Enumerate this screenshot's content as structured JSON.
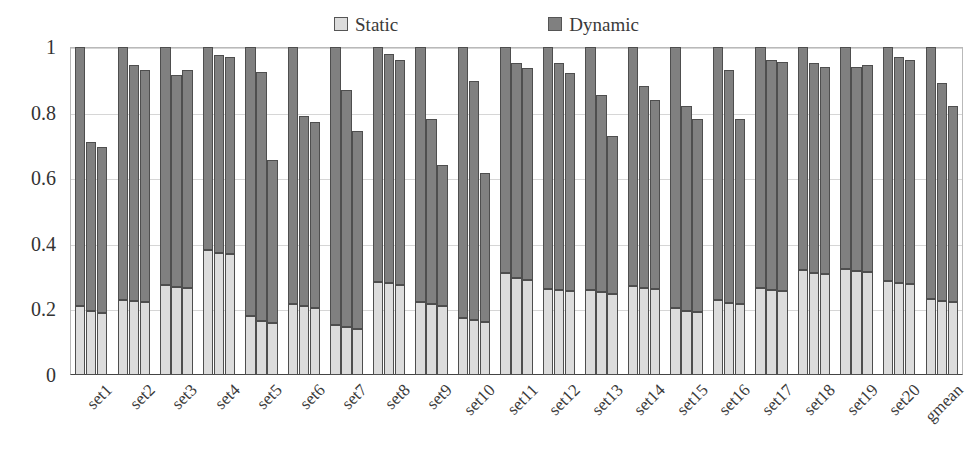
{
  "chart_data": {
    "type": "bar",
    "title": "",
    "subtitle": "",
    "xlabel": "",
    "ylabel": "",
    "ylim": [
      0,
      1
    ],
    "ytick_labels": [
      "0",
      "0.2",
      "0.4",
      "0.6",
      "0.8",
      "1"
    ],
    "ytick_values": [
      0,
      0.2,
      0.4,
      0.6,
      0.8,
      1
    ],
    "grid": true,
    "stacked": true,
    "legend_position": "top-center",
    "legend": [
      {
        "name": "Static",
        "color": "#dcdcdc",
        "icon": "legend-swatch-static"
      },
      {
        "name": "Dynamic",
        "color": "#808080",
        "icon": "legend-swatch-dynamic"
      }
    ],
    "series_names": [
      "Static",
      "Dynamic"
    ],
    "bars_per_group": 3,
    "categories": [
      "set1",
      "set2",
      "set3",
      "set4",
      "set5",
      "set6",
      "set7",
      "set8",
      "set9",
      "set10",
      "set11",
      "set12",
      "set13",
      "set14",
      "set15",
      "set16",
      "set17",
      "set18",
      "set19",
      "set20",
      "gmean"
    ],
    "groups": [
      {
        "category": "set1",
        "bars": [
          {
            "static": 0.21,
            "dynamic": 0.79,
            "total": 1.0
          },
          {
            "static": 0.195,
            "dynamic": 0.515,
            "total": 0.71
          },
          {
            "static": 0.19,
            "dynamic": 0.505,
            "total": 0.695
          }
        ]
      },
      {
        "category": "set2",
        "bars": [
          {
            "static": 0.23,
            "dynamic": 0.77,
            "total": 1.0
          },
          {
            "static": 0.225,
            "dynamic": 0.72,
            "total": 0.945
          },
          {
            "static": 0.222,
            "dynamic": 0.708,
            "total": 0.93
          }
        ]
      },
      {
        "category": "set3",
        "bars": [
          {
            "static": 0.275,
            "dynamic": 0.725,
            "total": 1.0
          },
          {
            "static": 0.268,
            "dynamic": 0.647,
            "total": 0.915
          },
          {
            "static": 0.265,
            "dynamic": 0.665,
            "total": 0.93
          }
        ]
      },
      {
        "category": "set4",
        "bars": [
          {
            "static": 0.38,
            "dynamic": 0.62,
            "total": 1.0
          },
          {
            "static": 0.372,
            "dynamic": 0.603,
            "total": 0.975
          },
          {
            "static": 0.368,
            "dynamic": 0.602,
            "total": 0.97
          }
        ]
      },
      {
        "category": "set5",
        "bars": [
          {
            "static": 0.18,
            "dynamic": 0.82,
            "total": 1.0
          },
          {
            "static": 0.165,
            "dynamic": 0.76,
            "total": 0.925
          },
          {
            "static": 0.16,
            "dynamic": 0.495,
            "total": 0.655
          }
        ]
      },
      {
        "category": "set6",
        "bars": [
          {
            "static": 0.215,
            "dynamic": 0.785,
            "total": 1.0
          },
          {
            "static": 0.21,
            "dynamic": 0.58,
            "total": 0.79
          },
          {
            "static": 0.205,
            "dynamic": 0.565,
            "total": 0.77
          }
        ]
      },
      {
        "category": "set7",
        "bars": [
          {
            "static": 0.152,
            "dynamic": 0.848,
            "total": 1.0
          },
          {
            "static": 0.145,
            "dynamic": 0.725,
            "total": 0.87
          },
          {
            "static": 0.14,
            "dynamic": 0.605,
            "total": 0.745
          }
        ]
      },
      {
        "category": "set8",
        "bars": [
          {
            "static": 0.285,
            "dynamic": 0.715,
            "total": 1.0
          },
          {
            "static": 0.28,
            "dynamic": 0.7,
            "total": 0.98
          },
          {
            "static": 0.275,
            "dynamic": 0.685,
            "total": 0.96
          }
        ]
      },
      {
        "category": "set9",
        "bars": [
          {
            "static": 0.222,
            "dynamic": 0.778,
            "total": 1.0
          },
          {
            "static": 0.215,
            "dynamic": 0.565,
            "total": 0.78
          },
          {
            "static": 0.21,
            "dynamic": 0.43,
            "total": 0.64
          }
        ]
      },
      {
        "category": "set10",
        "bars": [
          {
            "static": 0.175,
            "dynamic": 0.825,
            "total": 1.0
          },
          {
            "static": 0.168,
            "dynamic": 0.727,
            "total": 0.895
          },
          {
            "static": 0.162,
            "dynamic": 0.453,
            "total": 0.615
          }
        ]
      },
      {
        "category": "set11",
        "bars": [
          {
            "static": 0.31,
            "dynamic": 0.69,
            "total": 1.0
          },
          {
            "static": 0.295,
            "dynamic": 0.655,
            "total": 0.95
          },
          {
            "static": 0.29,
            "dynamic": 0.645,
            "total": 0.935
          }
        ]
      },
      {
        "category": "set12",
        "bars": [
          {
            "static": 0.262,
            "dynamic": 0.738,
            "total": 1.0
          },
          {
            "static": 0.258,
            "dynamic": 0.692,
            "total": 0.95
          },
          {
            "static": 0.255,
            "dynamic": 0.665,
            "total": 0.92
          }
        ]
      },
      {
        "category": "set13",
        "bars": [
          {
            "static": 0.258,
            "dynamic": 0.742,
            "total": 1.0
          },
          {
            "static": 0.252,
            "dynamic": 0.603,
            "total": 0.855
          },
          {
            "static": 0.248,
            "dynamic": 0.482,
            "total": 0.73
          }
        ]
      },
      {
        "category": "set14",
        "bars": [
          {
            "static": 0.272,
            "dynamic": 0.728,
            "total": 1.0
          },
          {
            "static": 0.266,
            "dynamic": 0.614,
            "total": 0.88
          },
          {
            "static": 0.262,
            "dynamic": 0.578,
            "total": 0.84
          }
        ]
      },
      {
        "category": "set15",
        "bars": [
          {
            "static": 0.205,
            "dynamic": 0.795,
            "total": 1.0
          },
          {
            "static": 0.196,
            "dynamic": 0.624,
            "total": 0.82
          },
          {
            "static": 0.192,
            "dynamic": 0.588,
            "total": 0.78
          }
        ]
      },
      {
        "category": "set16",
        "bars": [
          {
            "static": 0.228,
            "dynamic": 0.772,
            "total": 1.0
          },
          {
            "static": 0.22,
            "dynamic": 0.71,
            "total": 0.93
          },
          {
            "static": 0.215,
            "dynamic": 0.565,
            "total": 0.78
          }
        ]
      },
      {
        "category": "set17",
        "bars": [
          {
            "static": 0.265,
            "dynamic": 0.735,
            "total": 1.0
          },
          {
            "static": 0.258,
            "dynamic": 0.702,
            "total": 0.96
          },
          {
            "static": 0.255,
            "dynamic": 0.7,
            "total": 0.955
          }
        ]
      },
      {
        "category": "set18",
        "bars": [
          {
            "static": 0.32,
            "dynamic": 0.68,
            "total": 1.0
          },
          {
            "static": 0.312,
            "dynamic": 0.638,
            "total": 0.95
          },
          {
            "static": 0.308,
            "dynamic": 0.632,
            "total": 0.94
          }
        ]
      },
      {
        "category": "set19",
        "bars": [
          {
            "static": 0.322,
            "dynamic": 0.678,
            "total": 1.0
          },
          {
            "static": 0.318,
            "dynamic": 0.622,
            "total": 0.94
          },
          {
            "static": 0.315,
            "dynamic": 0.63,
            "total": 0.945
          }
        ]
      },
      {
        "category": "set20",
        "bars": [
          {
            "static": 0.288,
            "dynamic": 0.712,
            "total": 1.0
          },
          {
            "static": 0.282,
            "dynamic": 0.688,
            "total": 0.97
          },
          {
            "static": 0.278,
            "dynamic": 0.682,
            "total": 0.96
          }
        ]
      },
      {
        "category": "gmean",
        "bars": [
          {
            "static": 0.232,
            "dynamic": 0.768,
            "total": 1.0
          },
          {
            "static": 0.226,
            "dynamic": 0.664,
            "total": 0.89
          },
          {
            "static": 0.222,
            "dynamic": 0.598,
            "total": 0.82
          }
        ]
      }
    ]
  }
}
